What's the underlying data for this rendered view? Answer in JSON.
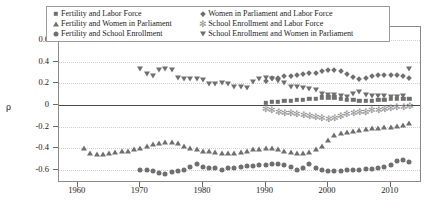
{
  "chart_data": {
    "type": "scatter",
    "title": "",
    "xlabel": "",
    "ylabel": "ρ",
    "xlim": [
      1957,
      2015
    ],
    "ylim": [
      -0.72,
      0.72
    ],
    "xticks": [
      1960,
      1970,
      1980,
      1990,
      2000,
      2010
    ],
    "yticks": [
      0.6,
      0.4,
      0.2,
      0,
      -0.2,
      -0.4,
      -0.6
    ],
    "ytick_labels": [
      "0.6",
      "0.4",
      "0.2",
      "0",
      "-0.2",
      "-0.4",
      "-0.6"
    ],
    "xtick_labels": [
      "1960",
      "1970",
      "1980",
      "1990",
      "2000",
      "2010"
    ],
    "grid": true,
    "zero_line": true,
    "legend_position": "top",
    "marker_color": "#6f6f6f",
    "series": [
      {
        "name": "Fertility and Labor Force",
        "marker": "square",
        "x": [
          1990,
          1991,
          1992,
          1993,
          1994,
          1995,
          1996,
          1997,
          1998,
          1999,
          2000,
          2001,
          2002,
          2003,
          2004,
          2005,
          2006,
          2007,
          2008,
          2009,
          2010,
          2011,
          2012,
          2013
        ],
        "y": [
          0.02,
          0.03,
          0.03,
          0.04,
          0.04,
          0.05,
          0.05,
          0.06,
          0.06,
          0.07,
          0.07,
          0.07,
          0.06,
          0.05,
          0.05,
          0.04,
          0.04,
          0.04,
          0.05,
          0.05,
          0.06,
          0.06,
          0.06,
          0.06
        ]
      },
      {
        "name": "Fertility and Women in Parliament",
        "marker": "triangle-up",
        "x": [
          1961,
          1962,
          1963,
          1964,
          1965,
          1966,
          1967,
          1968,
          1969,
          1970,
          1971,
          1972,
          1973,
          1974,
          1975,
          1976,
          1977,
          1978,
          1979,
          1980,
          1981,
          1982,
          1983,
          1984,
          1985,
          1986,
          1987,
          1988,
          1989,
          1990,
          1991,
          1992,
          1993,
          1994,
          1995,
          1996,
          1997,
          1998,
          1999,
          2000,
          2001,
          2002,
          2003,
          2004,
          2005,
          2006,
          2007,
          2008,
          2009,
          2010,
          2011,
          2012,
          2013
        ],
        "y": [
          -0.4,
          -0.44,
          -0.45,
          -0.45,
          -0.44,
          -0.43,
          -0.42,
          -0.42,
          -0.41,
          -0.4,
          -0.38,
          -0.36,
          -0.35,
          -0.34,
          -0.34,
          -0.35,
          -0.38,
          -0.4,
          -0.41,
          -0.42,
          -0.42,
          -0.43,
          -0.44,
          -0.44,
          -0.44,
          -0.43,
          -0.42,
          -0.41,
          -0.41,
          -0.4,
          -0.4,
          -0.41,
          -0.42,
          -0.43,
          -0.44,
          -0.44,
          -0.43,
          -0.41,
          -0.38,
          -0.32,
          -0.28,
          -0.26,
          -0.25,
          -0.24,
          -0.23,
          -0.22,
          -0.21,
          -0.21,
          -0.2,
          -0.2,
          -0.19,
          -0.18,
          -0.17
        ]
      },
      {
        "name": "Fertility and School Enrollment",
        "marker": "circle",
        "x": [
          1970,
          1971,
          1972,
          1973,
          1974,
          1975,
          1976,
          1977,
          1978,
          1979,
          1980,
          1981,
          1982,
          1983,
          1984,
          1985,
          1986,
          1987,
          1988,
          1989,
          1990,
          1991,
          1992,
          1993,
          1994,
          1995,
          1996,
          1997,
          1998,
          1999,
          2000,
          2001,
          2002,
          2003,
          2004,
          2005,
          2006,
          2007,
          2008,
          2009,
          2010,
          2011,
          2012,
          2013
        ],
        "y": [
          -0.6,
          -0.6,
          -0.61,
          -0.63,
          -0.64,
          -0.62,
          -0.61,
          -0.6,
          -0.57,
          -0.54,
          -0.57,
          -0.58,
          -0.58,
          -0.6,
          -0.58,
          -0.58,
          -0.57,
          -0.56,
          -0.56,
          -0.55,
          -0.55,
          -0.54,
          -0.54,
          -0.55,
          -0.57,
          -0.6,
          -0.58,
          -0.54,
          -0.58,
          -0.6,
          -0.61,
          -0.61,
          -0.61,
          -0.6,
          -0.6,
          -0.6,
          -0.59,
          -0.59,
          -0.58,
          -0.57,
          -0.55,
          -0.52,
          -0.51,
          -0.53
        ]
      },
      {
        "name": "Women in Parliament and Labor Force",
        "marker": "diamond",
        "x": [
          1990,
          1991,
          1992,
          1993,
          1994,
          1995,
          1996,
          1997,
          1998,
          1999,
          2000,
          2001,
          2002,
          2003,
          2004,
          2005,
          2006,
          2007,
          2008,
          2009,
          2010,
          2011,
          2012,
          2013
        ],
        "y": [
          0.22,
          0.25,
          0.25,
          0.27,
          0.27,
          0.28,
          0.29,
          0.3,
          0.3,
          0.31,
          0.32,
          0.32,
          0.31,
          0.29,
          0.26,
          0.24,
          0.25,
          0.27,
          0.28,
          0.28,
          0.28,
          0.28,
          0.27,
          0.25
        ]
      },
      {
        "name": "School Enrollment and Labor Force",
        "marker": "asterisk",
        "x": [
          1990,
          1991,
          1992,
          1993,
          1994,
          1995,
          1996,
          1997,
          1998,
          1999,
          2000,
          2001,
          2002,
          2003,
          2004,
          2005,
          2006,
          2007,
          2008,
          2009,
          2010,
          2011,
          2012,
          2013
        ],
        "y": [
          -0.04,
          -0.05,
          -0.06,
          -0.07,
          -0.07,
          -0.08,
          -0.09,
          -0.1,
          -0.11,
          -0.12,
          -0.13,
          -0.12,
          -0.1,
          -0.08,
          -0.07,
          -0.06,
          -0.06,
          -0.05,
          -0.05,
          -0.04,
          -0.03,
          -0.02,
          -0.02,
          -0.01
        ]
      },
      {
        "name": "School Enrollment and Women in Parliament",
        "marker": "triangle-down",
        "x": [
          1970,
          1971,
          1972,
          1973,
          1974,
          1975,
          1976,
          1977,
          1978,
          1979,
          1980,
          1981,
          1982,
          1983,
          1984,
          1985,
          1986,
          1987,
          1988,
          1989,
          1990,
          1991,
          1992,
          1993,
          1994,
          1995,
          1996,
          1997,
          1998,
          1999,
          2000,
          2001,
          2002,
          2003,
          2004,
          2005,
          2006,
          2007,
          2008,
          2009,
          2010,
          2011,
          2012,
          2013
        ],
        "y": [
          0.33,
          0.29,
          0.27,
          0.32,
          0.33,
          0.32,
          0.25,
          0.24,
          0.24,
          0.24,
          0.23,
          0.19,
          0.19,
          0.2,
          0.19,
          0.17,
          0.17,
          0.16,
          0.21,
          0.24,
          0.25,
          0.24,
          0.22,
          0.2,
          0.17,
          0.17,
          0.16,
          0.15,
          0.14,
          0.1,
          0.09,
          0.09,
          0.08,
          0.07,
          0.1,
          0.12,
          0.09,
          0.08,
          0.08,
          0.08,
          0.07,
          0.07,
          0.08,
          0.33
        ]
      }
    ]
  },
  "legend": {
    "entries": [
      {
        "label": "Fertility and Labor Force",
        "marker": "square"
      },
      {
        "label": "Fertility and Women in Parliament",
        "marker": "triangle-up"
      },
      {
        "label": "Fertility and School Enrollment",
        "marker": "circle"
      },
      {
        "label": "Women in Parliament and Labor Force",
        "marker": "diamond"
      },
      {
        "label": "School Enrollment and Labor Force",
        "marker": "asterisk"
      },
      {
        "label": "School Enrollment and Women in Parliament",
        "marker": "triangle-down"
      }
    ]
  }
}
